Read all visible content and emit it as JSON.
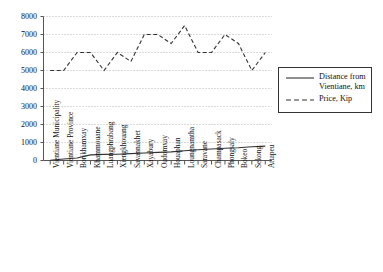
{
  "chart_data": {
    "type": "line",
    "title": "",
    "xlabel": "",
    "ylabel": "",
    "ylim": [
      0,
      8000
    ],
    "ytick_labels": [
      "8000",
      "7000",
      "6000",
      "5000",
      "4000",
      "3000",
      "2000",
      "1000",
      "0"
    ],
    "ytick_values": [
      8000,
      7000,
      6000,
      5000,
      4000,
      3000,
      2000,
      1000,
      0
    ],
    "grid": true,
    "grid_style": "dotted-horizontal",
    "legend_position": "right",
    "categories": [
      "Vientiane Municipality",
      "Vientiane Province",
      "Borikhamxay",
      "Khammouane",
      "Luangphrabang",
      "Xiengkhouang",
      "Savannakhet",
      "Xayabury",
      "Oudomxay",
      "Houaphan",
      "Loungnamtha",
      "Saravane",
      "Champasack",
      "Phongsaly",
      "Bokeo",
      "Sekong",
      "Attapeu"
    ],
    "series": [
      {
        "name": "Distance from Vientiane, km",
        "style": "solid",
        "color": "#333333",
        "values": [
          10,
          80,
          140,
          310,
          340,
          350,
          380,
          420,
          450,
          480,
          540,
          600,
          640,
          680,
          710,
          760,
          800
        ]
      },
      {
        "name": "Price, Kip",
        "style": "dashed",
        "color": "#333333",
        "values": [
          5000,
          5000,
          6000,
          6000,
          5000,
          6000,
          5500,
          7000,
          7000,
          6500,
          7500,
          6000,
          6000,
          7000,
          6500,
          5000,
          6000
        ]
      }
    ]
  },
  "legend": {
    "items": [
      {
        "label_line1": "Distance from",
        "label_line2": "Vientiane, km",
        "style": "solid"
      },
      {
        "label_line1": "Price, Kip",
        "label_line2": "",
        "style": "dashed"
      }
    ]
  }
}
